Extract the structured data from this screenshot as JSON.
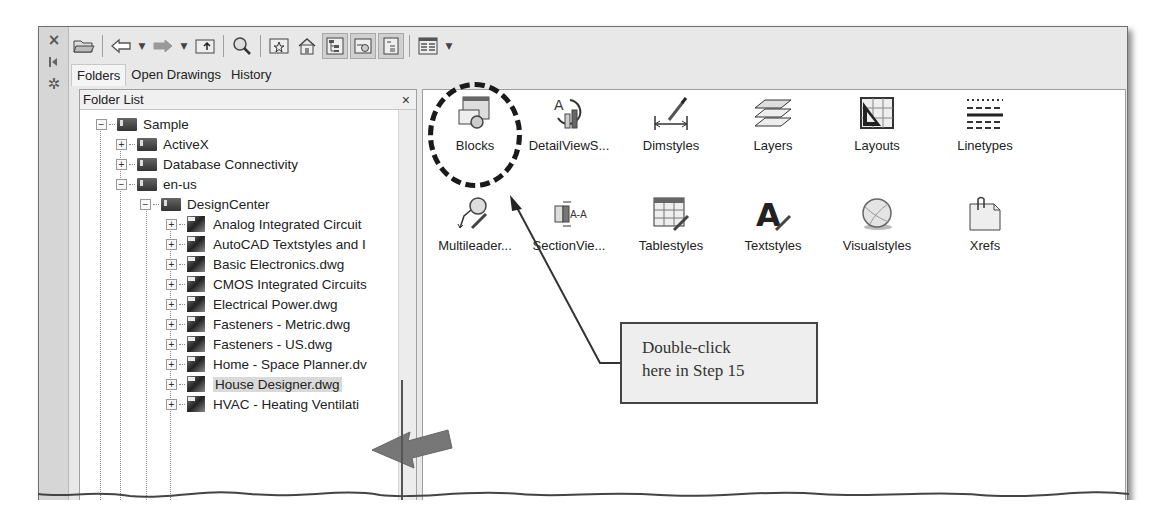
{
  "side_strip": {
    "buttons": [
      {
        "icon": "close-icon",
        "glyph": "×"
      },
      {
        "icon": "auto-hide-icon",
        "glyph": "⧓"
      },
      {
        "icon": "properties-icon",
        "glyph": "✲"
      }
    ]
  },
  "toolbar": {
    "buttons": [
      {
        "icon": "load-folder-icon"
      },
      {
        "icon": "back-icon",
        "dropdown": true
      },
      {
        "icon": "forward-icon",
        "dropdown": true
      },
      {
        "icon": "up-folder-icon"
      },
      {
        "icon": "search-icon"
      },
      {
        "icon": "favorites-icon"
      },
      {
        "icon": "home-icon"
      },
      {
        "icon": "tree-view-toggle-icon",
        "pressed": true
      },
      {
        "icon": "preview-icon",
        "pressed": true
      },
      {
        "icon": "description-icon",
        "pressed": true
      },
      {
        "icon": "views-icon",
        "dropdown": true
      }
    ]
  },
  "tabs": [
    {
      "label": "Folders",
      "active": true
    },
    {
      "label": "Open Drawings",
      "active": false
    },
    {
      "label": "History",
      "active": false
    }
  ],
  "folder_panel": {
    "title": "Folder List",
    "close_glyph": "×",
    "tree": [
      {
        "label": "Sample",
        "level": 0,
        "expander": "−",
        "type": "folder"
      },
      {
        "label": "ActiveX",
        "level": 1,
        "expander": "+",
        "type": "folder"
      },
      {
        "label": "Database Connectivity",
        "level": 1,
        "expander": "+",
        "type": "folder"
      },
      {
        "label": "en-us",
        "level": 1,
        "expander": "−",
        "type": "folder"
      },
      {
        "label": "DesignCenter",
        "level": 2,
        "expander": "−",
        "type": "folder"
      },
      {
        "label": "Analog Integrated Circuit",
        "level": 3,
        "expander": "+",
        "type": "dwg"
      },
      {
        "label": "AutoCAD Textstyles and I",
        "level": 3,
        "expander": "+",
        "type": "dwg"
      },
      {
        "label": "Basic Electronics.dwg",
        "level": 3,
        "expander": "+",
        "type": "dwg"
      },
      {
        "label": "CMOS Integrated Circuits",
        "level": 3,
        "expander": "+",
        "type": "dwg"
      },
      {
        "label": "Electrical Power.dwg",
        "level": 3,
        "expander": "+",
        "type": "dwg"
      },
      {
        "label": "Fasteners - Metric.dwg",
        "level": 3,
        "expander": "+",
        "type": "dwg"
      },
      {
        "label": "Fasteners - US.dwg",
        "level": 3,
        "expander": "+",
        "type": "dwg"
      },
      {
        "label": "Home - Space Planner.dv",
        "level": 3,
        "expander": "+",
        "type": "dwg"
      },
      {
        "label": "House Designer.dwg",
        "level": 3,
        "expander": "+",
        "type": "dwg",
        "selected": true
      },
      {
        "label": "HVAC - Heating Ventilati",
        "level": 3,
        "expander": "+",
        "type": "dwg"
      }
    ]
  },
  "content_items": [
    {
      "label": "Blocks",
      "icon": "blocks-icon"
    },
    {
      "label": "DetailViewS...",
      "icon": "detail-view-styles-icon"
    },
    {
      "label": "Dimstyles",
      "icon": "dimstyles-icon"
    },
    {
      "label": "Layers",
      "icon": "layers-icon"
    },
    {
      "label": "Layouts",
      "icon": "layouts-icon"
    },
    {
      "label": "Linetypes",
      "icon": "linetypes-icon"
    },
    {
      "label": "Multileader...",
      "icon": "multileader-styles-icon"
    },
    {
      "label": "SectionVie...",
      "icon": "section-view-styles-icon"
    },
    {
      "label": "Tablestyles",
      "icon": "tablestyles-icon"
    },
    {
      "label": "Textstyles",
      "icon": "textstyles-icon"
    },
    {
      "label": "Visualstyles",
      "icon": "visualstyles-icon"
    },
    {
      "label": "Xrefs",
      "icon": "xrefs-icon"
    }
  ],
  "annotation": {
    "callout_line1": "Double-click",
    "callout_line2": "here in Step 15",
    "section_label_glyph": "A-A",
    "dimstyle_letter": "A",
    "textstyle_letter": "A"
  }
}
